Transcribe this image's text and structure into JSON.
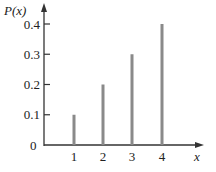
{
  "chart_data": {
    "type": "bar",
    "title": "",
    "xlabel": "x",
    "ylabel": "P(x)",
    "categories": [
      "1",
      "2",
      "3",
      "4"
    ],
    "values": [
      0.1,
      0.2,
      0.3,
      0.4
    ],
    "ylim": [
      0,
      0.45
    ],
    "yticks": [
      "0",
      "0.1",
      "0.2",
      "0.3",
      "0.4"
    ],
    "grid": false,
    "legend": null,
    "bar_color": "#8a8a8a",
    "axis_color": "#333333"
  },
  "labels": {
    "ylabel": "P(x)",
    "xlabel": "x",
    "origin": "0",
    "yticks": [
      "0.1",
      "0.2",
      "0.3",
      "0.4"
    ],
    "xticks": [
      "1",
      "2",
      "3",
      "4"
    ]
  }
}
